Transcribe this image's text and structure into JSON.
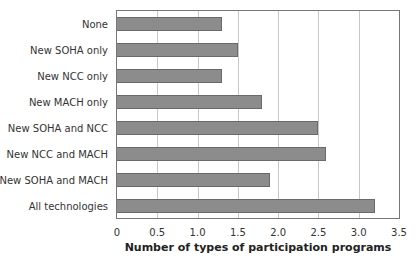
{
  "chart_data": {
    "type": "bar",
    "orientation": "horizontal",
    "title": "",
    "xlabel": "Number of types of participation programs",
    "ylabel": "",
    "xlim": [
      0,
      3.5
    ],
    "xticks": [
      "0",
      "0.5",
      "1.0",
      "1.5",
      "2.0",
      "2.5",
      "3.0",
      "3.5"
    ],
    "grid": "vertical",
    "legend": null,
    "bar_color": "#8c8c8c",
    "categories": [
      "None",
      "New SOHA only",
      "New NCC only",
      "New MACH only",
      "New SOHA and NCC",
      "New NCC and MACH",
      "New SOHA and MACH",
      "All technologies"
    ],
    "values": [
      1.3,
      1.5,
      1.3,
      1.8,
      2.5,
      2.6,
      1.9,
      3.2
    ]
  }
}
